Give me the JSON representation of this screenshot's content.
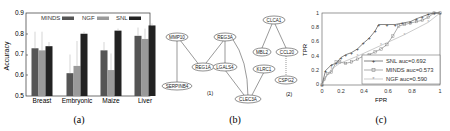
{
  "chart_data": [
    {
      "type": "bar",
      "panel": "(a)",
      "title": "",
      "xlabel": "",
      "ylabel": "Accuracy",
      "ylim": [
        0.5,
        0.9
      ],
      "yticks": [
        "0.5",
        "0.6",
        "0.7",
        "0.8",
        "0.9"
      ],
      "categories": [
        "Breast",
        "Embryonic",
        "Maize",
        "Liver"
      ],
      "series": [
        {
          "name": "MINDS",
          "color": "#555555",
          "values": [
            0.73,
            0.61,
            0.72,
            0.79
          ],
          "err": [
            0.08,
            0.09,
            0.04,
            0.04
          ]
        },
        {
          "name": "NGF",
          "color": "#9a9a9a",
          "values": [
            0.72,
            0.645,
            0.625,
            0.775
          ],
          "err": [
            0.09,
            0.12,
            0.08,
            0.05
          ]
        },
        {
          "name": "SNL",
          "color": "#222222",
          "values": [
            0.74,
            0.8,
            0.815,
            0.84
          ],
          "err": [
            0.02,
            0.01,
            0.01,
            0.01
          ]
        }
      ],
      "legend_position": "top"
    },
    {
      "type": "line",
      "panel": "(c)",
      "title": "",
      "xlabel": "FPR",
      "ylabel": "TPR",
      "xlim": [
        0,
        1
      ],
      "ylim": [
        0,
        1
      ],
      "xticks": [
        "0",
        "0.2",
        "0.4",
        "0.6",
        "0.8",
        "1"
      ],
      "yticks": [
        "0",
        "0.2",
        "0.4",
        "0.6",
        "0.8",
        "1"
      ],
      "series": [
        {
          "name": "SNL auc=0.692",
          "marker": "+",
          "color": "#333333",
          "x": [
            0,
            0.03,
            0.08,
            0.12,
            0.16,
            0.2,
            0.25,
            0.3,
            0.35,
            0.4,
            0.45,
            0.48,
            0.55,
            0.62,
            0.68,
            0.75,
            0.8,
            0.85,
            0.9,
            0.95,
            1
          ],
          "y": [
            0,
            0.2,
            0.28,
            0.3,
            0.38,
            0.42,
            0.45,
            0.5,
            0.58,
            0.65,
            0.75,
            0.84,
            0.84,
            0.84,
            0.86,
            0.88,
            0.92,
            0.95,
            0.98,
            1,
            1
          ]
        },
        {
          "name": "MINDS auc=0.573",
          "marker": "square",
          "color": "#777777",
          "x": [
            0,
            0.02,
            0.05,
            0.08,
            0.12,
            0.15,
            0.2,
            0.25,
            0.3,
            0.35,
            0.4,
            0.45,
            0.5,
            0.55,
            0.6,
            0.65,
            0.7,
            0.75,
            0.8,
            0.85,
            0.9,
            0.95,
            1
          ],
          "y": [
            0,
            0.08,
            0.16,
            0.18,
            0.32,
            0.32,
            0.3,
            0.32,
            0.36,
            0.4,
            0.42,
            0.46,
            0.5,
            0.56,
            0.68,
            0.82,
            0.84,
            0.86,
            0.88,
            0.9,
            0.94,
            1,
            1
          ]
        },
        {
          "name": "NGF auc=0.590",
          "marker": "*",
          "color": "#aaaaaa",
          "x": [
            0,
            0.03,
            0.08,
            0.15,
            0.3,
            0.5,
            0.7,
            0.9,
            1
          ],
          "y": [
            0,
            0.1,
            0.22,
            0.3,
            0.4,
            0.55,
            0.7,
            0.87,
            1
          ]
        }
      ],
      "legend_position": "lower right"
    }
  ],
  "panels": {
    "a": {
      "caption": "(a)",
      "ylabel": "Accuracy",
      "yticks": [
        "0.5",
        "0.6",
        "0.7",
        "0.8",
        "0.9"
      ],
      "categories": [
        "Breast",
        "Embryonic",
        "Maize",
        "Liver"
      ],
      "legend": [
        "MINDS",
        "NGF",
        "SNL"
      ]
    },
    "b": {
      "caption": "(b)",
      "group1_label": "(1)",
      "group2_label": "(2)",
      "nodes": {
        "mmp10": "MMP10",
        "serpinb": "SERPINB4",
        "reg3a": "REG3A",
        "reg1a": "REG1A",
        "lgals4": "LGALS4",
        "clec3a": "CLEC3A",
        "klrc1": "KLRC1",
        "clca1": "CLCA1",
        "mbl2": "MBL2",
        "ccl20": "CCL20",
        "cspg2": "CSPG2"
      }
    },
    "c": {
      "caption": "(c)",
      "xlabel": "FPR",
      "ylabel": "TPR",
      "xticks": [
        "0",
        "0.2",
        "0.4",
        "0.6",
        "0.8",
        "1"
      ],
      "yticks": [
        "0",
        "0.2",
        "0.4",
        "0.6",
        "0.8",
        "1"
      ],
      "legend": [
        "SNL auc=0.692",
        "MINDS auc=0.573",
        "NGF auc=0.590"
      ]
    }
  }
}
